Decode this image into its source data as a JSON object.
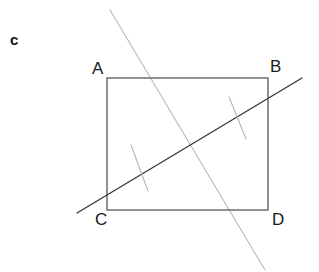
{
  "figure": {
    "part_label": "c",
    "background_color": "#ffffff",
    "width": 319,
    "height": 272,
    "vertices": {
      "a": "A",
      "b": "B",
      "c": "C",
      "d": "D"
    },
    "colors": {
      "rectangle_stroke": "#6e6e6e",
      "dark_line_stroke": "#3b3b3b",
      "light_line_stroke": "#b9b9b9",
      "tick_stroke": "#b5b5b5",
      "label_text": "#1a1a1a",
      "part_label_text": "#111111"
    },
    "geometry": {
      "rectangle": {
        "x1": 107,
        "y1": 78,
        "x2": 268,
        "y2": 210,
        "stroke_width": 1.5
      },
      "dark_transversal": {
        "x1": 77,
        "y1": 213,
        "x2": 302,
        "y2": 78,
        "stroke_width": 1.4
      },
      "light_transversal": {
        "x1": 110,
        "y1": 10,
        "x2": 265,
        "y2": 270,
        "stroke_width": 1.1
      },
      "tick_lower_left": {
        "x1": 131,
        "y1": 145,
        "x2": 148,
        "y2": 191,
        "stroke_width": 1.1
      },
      "tick_upper_right": {
        "x1": 229,
        "y1": 97,
        "x2": 246,
        "y2": 139,
        "stroke_width": 1.1
      }
    }
  }
}
